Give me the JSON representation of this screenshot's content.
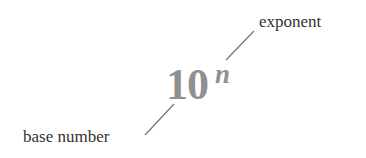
{
  "diagram": {
    "expression": {
      "base": "10",
      "exponent": "n",
      "color": "#909090"
    },
    "labels": {
      "exponent": "exponent",
      "base": "base number",
      "color": "#333333"
    },
    "leader_lines": [
      {
        "name": "exponent-leader",
        "x1": 226,
        "y1": 60,
        "x2": 254,
        "y2": 31
      },
      {
        "name": "base-leader",
        "x1": 145,
        "y1": 135,
        "x2": 174,
        "y2": 104
      }
    ],
    "leader_color": "#777777"
  }
}
